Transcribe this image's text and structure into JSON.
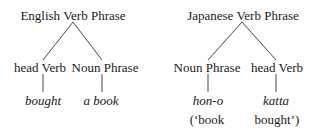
{
  "trees": [
    {
      "name": "english",
      "root": "English Verb Phrase",
      "children": [
        {
          "label": "head Verb",
          "word": "bought"
        },
        {
          "label": "Noun Phrase",
          "word": "a book"
        }
      ]
    },
    {
      "name": "japanese",
      "root": "Japanese Verb Phrase",
      "children": [
        {
          "label": "Noun Phrase",
          "word": "hon-o",
          "gloss": "(‘book"
        },
        {
          "label": "head Verb",
          "word": "katta",
          "gloss": "bought’)"
        }
      ]
    }
  ],
  "colors": {
    "ink": "#1a1a1a",
    "background": "#ffffff"
  }
}
